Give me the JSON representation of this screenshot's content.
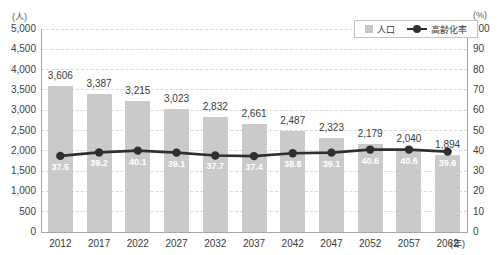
{
  "units": {
    "left": "(人)",
    "right": "(%)",
    "x": "(年)"
  },
  "legend": {
    "items": [
      {
        "label": "人口",
        "type": "bar"
      },
      {
        "label": "高齢化率",
        "type": "line"
      }
    ]
  },
  "chart_data": {
    "type": "bar+line",
    "title": "",
    "categories": [
      "2012",
      "2017",
      "2022",
      "2027",
      "2032",
      "2037",
      "2042",
      "2047",
      "2052",
      "2057",
      "2062"
    ],
    "series": [
      {
        "name": "人口",
        "type": "bar",
        "axis": "left",
        "values": [
          3606,
          3387,
          3215,
          3023,
          2832,
          2661,
          2487,
          2323,
          2179,
          2040,
          1894
        ],
        "data_labels": [
          "3,606",
          "3,387",
          "3,215",
          "3,023",
          "2,832",
          "2,661",
          "2,487",
          "2,323",
          "2,179",
          "2,040",
          "1,894"
        ]
      },
      {
        "name": "高齢化率",
        "type": "line",
        "axis": "right",
        "values": [
          37.5,
          39.2,
          40.1,
          39.1,
          37.7,
          37.4,
          38.8,
          39.1,
          40.6,
          40.6,
          39.6
        ],
        "data_labels": [
          "37.5",
          "39.2",
          "40.1",
          "39.1",
          "37.7",
          "37.4",
          "38.8",
          "39.1",
          "40.6",
          "40.6",
          "39.6"
        ]
      }
    ],
    "left_axis": {
      "label": "(人)",
      "min": 0,
      "max": 5000,
      "step": 500,
      "ticks": [
        "0",
        "500",
        "1,000",
        "1,500",
        "2,000",
        "2,500",
        "3,000",
        "3,500",
        "4,000",
        "4,500",
        "5,000"
      ]
    },
    "right_axis": {
      "label": "(%)",
      "min": 0,
      "max": 100,
      "step": 10,
      "ticks": [
        "0",
        "10",
        "20",
        "30",
        "40",
        "50",
        "60",
        "70",
        "80",
        "90",
        "100"
      ]
    },
    "x_axis": {
      "label": "(年)"
    },
    "grid": "horizontal-dashed",
    "legend_position": "top-right-inside",
    "colors": {
      "bar": "#cacaca",
      "line": "#2f2f2f",
      "marker": "#2f2f2f",
      "grid": "#d9d9d9",
      "axis": "#a6a6a6",
      "bar_value_label": "#3a3a3a",
      "point_label": "#ffffff",
      "tick_label": "#404040"
    }
  }
}
